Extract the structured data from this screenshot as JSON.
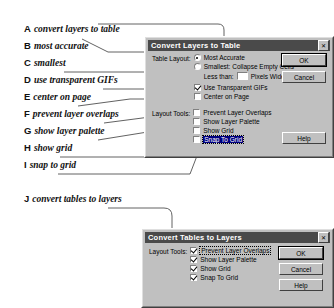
{
  "figure": {
    "callouts": [
      {
        "letter": "A",
        "text": "convert layers to table"
      },
      {
        "letter": "B",
        "text": "most accurate"
      },
      {
        "letter": "C",
        "text": "smallest"
      },
      {
        "letter": "D",
        "text": "use transparent GIFs"
      },
      {
        "letter": "E",
        "text": "center on page"
      },
      {
        "letter": "F",
        "text": "prevent layer overlaps"
      },
      {
        "letter": "G",
        "text": "show layer palette"
      },
      {
        "letter": "H",
        "text": "show grid"
      },
      {
        "letter": "I",
        "text": "snap to grid"
      },
      {
        "letter": "J",
        "text": "convert tables to layers"
      }
    ]
  },
  "dialog1": {
    "title": "Convert Layers to Table",
    "close_label": "✕",
    "table_layout_label": "Table Layout:",
    "layout_tools_label": "Layout Tools:",
    "options": {
      "most_accurate": "Most Accurate",
      "smallest": "Smallest: Collapse Empty Cells",
      "less_than": "Less than:",
      "pixels_wide": "Pixels Wide",
      "less_than_value": "",
      "use_transparent_gifs": "Use Transparent GIFs",
      "center_on_page": "Center on Page",
      "prevent_layer_overlaps": "Prevent Layer Overlaps",
      "show_layer_palette": "Show Layer Palette",
      "show_grid": "Show Grid",
      "snap_to_grid": "Snap To Grid"
    },
    "buttons": {
      "ok": "OK",
      "cancel": "Cancel",
      "help": "Help"
    }
  },
  "dialog2": {
    "title": "Convert Tables to Layers",
    "close_label": "✕",
    "layout_tools_label": "Layout Tools:",
    "options": {
      "prevent_layer_overlaps": "Prevent Layer Overlaps",
      "show_layer_palette": "Show Layer Palette",
      "show_grid": "Show Grid",
      "snap_to_grid": "Snap To Grid"
    },
    "buttons": {
      "ok": "OK",
      "cancel": "Cancel",
      "help": "Help"
    }
  }
}
